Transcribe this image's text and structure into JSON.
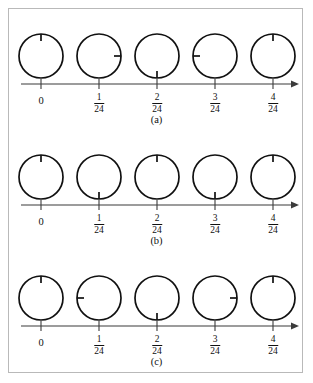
{
  "figure": {
    "panel_border_color": "#b9b9b9",
    "stroke_color": "#111111",
    "axis_color": "#3b3b3b",
    "background": "#ffffff",
    "axis": {
      "tick_labels": [
        "0",
        "1/24",
        "2/24",
        "3/24",
        "4/24"
      ],
      "fractions": [
        {
          "numerator": "",
          "denominator": "",
          "whole": "0"
        },
        {
          "numerator": "1",
          "denominator": "24",
          "whole": ""
        },
        {
          "numerator": "2",
          "denominator": "24",
          "whole": ""
        },
        {
          "numerator": "3",
          "denominator": "24",
          "whole": ""
        },
        {
          "numerator": "4",
          "denominator": "24",
          "whole": ""
        }
      ],
      "has_end_arrow": true
    },
    "rows": [
      {
        "id": "a",
        "caption": "(a)",
        "circles": [
          {
            "tick_angle_deg": 0,
            "arc": null
          },
          {
            "tick_angle_deg": 90,
            "arc": {
              "start_deg": 30,
              "sweep_deg": 65,
              "direction": "clockwise"
            }
          },
          {
            "tick_angle_deg": 180,
            "arc": {
              "start_deg": 55,
              "sweep_deg": 120,
              "direction": "clockwise"
            }
          },
          {
            "tick_angle_deg": 270,
            "arc": {
              "start_deg": 120,
              "sweep_deg": 145,
              "direction": "clockwise"
            }
          },
          {
            "tick_angle_deg": 0,
            "arc": {
              "start_deg": 230,
              "sweep_deg": 120,
              "direction": "clockwise"
            }
          }
        ]
      },
      {
        "id": "b",
        "caption": "(b)",
        "circles": [
          {
            "tick_angle_deg": 0,
            "arc": null
          },
          {
            "tick_angle_deg": 180,
            "arc": {
              "start_deg": 5,
              "sweep_deg": 175,
              "direction": "clockwise"
            }
          },
          {
            "tick_angle_deg": 0,
            "arc": {
              "start_deg": 10,
              "sweep_deg": 340,
              "direction": "clockwise"
            }
          },
          {
            "tick_angle_deg": 180,
            "arc": {
              "start_deg": 5,
              "sweep_deg": 175,
              "direction": "clockwise"
            }
          },
          {
            "tick_angle_deg": 0,
            "arc": {
              "start_deg": 10,
              "sweep_deg": 340,
              "direction": "clockwise"
            }
          }
        ]
      },
      {
        "id": "c",
        "caption": "(c)",
        "circles": [
          {
            "tick_angle_deg": 0,
            "arc": null
          },
          {
            "tick_angle_deg": 270,
            "arc": {
              "start_deg": 10,
              "sweep_deg": 255,
              "direction": "clockwise"
            }
          },
          {
            "tick_angle_deg": 180,
            "arc": {
              "start_deg": 290,
              "sweep_deg": 250,
              "direction": "clockwise"
            }
          },
          {
            "tick_angle_deg": 90,
            "arc": {
              "start_deg": 200,
              "sweep_deg": 250,
              "direction": "clockwise"
            }
          },
          {
            "tick_angle_deg": 0,
            "arc": {
              "start_deg": 110,
              "sweep_deg": 250,
              "direction": "clockwise"
            }
          }
        ]
      }
    ],
    "geometry": {
      "circle_radius": 22,
      "arc_radius_offset": 6,
      "tick_length": 7,
      "axis_y": 72,
      "circle_center_y": 44,
      "x_positions": [
        32,
        90,
        148,
        206,
        264
      ],
      "axis_start_x": 12,
      "axis_end_x": 288
    }
  }
}
